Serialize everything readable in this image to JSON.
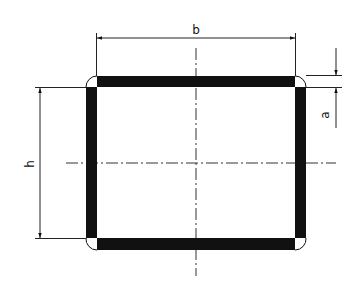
{
  "diagram": {
    "type": "technical-drawing",
    "colors": {
      "background": "#ffffff",
      "ink": "#111111",
      "thin_line": "#333333"
    },
    "profile": {
      "outer": {
        "x": 86,
        "y": 76,
        "w": 220,
        "h": 174
      },
      "wall_thickness": 11,
      "corner_radius": 11
    },
    "dimensions": {
      "b": {
        "label": "b",
        "description": "overall width",
        "x1": 97,
        "x2": 295,
        "y": 38
      },
      "h": {
        "label": "h",
        "description": "overall height",
        "y1": 87,
        "y2": 239,
        "x": 40
      },
      "a": {
        "label": "a",
        "description": "wall thickness",
        "y1": 76,
        "y2": 87,
        "x": 336
      }
    },
    "centerlines": {
      "vertical": {
        "x": 196,
        "y1": 48,
        "y2": 276
      },
      "horizontal": {
        "y": 163,
        "x1": 66,
        "x2": 336
      }
    }
  }
}
